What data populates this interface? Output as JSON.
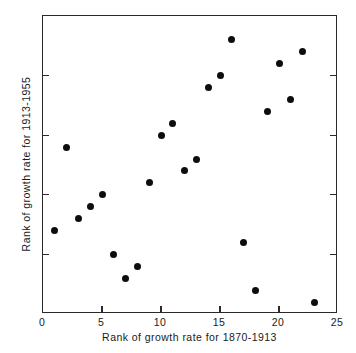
{
  "chart_data": {
    "type": "scatter",
    "title": "",
    "xlabel": "Rank of growth rate for 1870-1913",
    "ylabel": "Rank of growth rate for 1913-1955",
    "xlim": [
      0,
      25
    ],
    "ylim": [
      0,
      25
    ],
    "grid": false,
    "legend": null,
    "xticks": [
      0,
      5,
      10,
      15,
      20,
      25
    ],
    "yticks": [
      0,
      5,
      10,
      15,
      20,
      25
    ],
    "xtick_labels": [
      "0",
      "5",
      "10",
      "15",
      "20",
      "25"
    ],
    "ytick_labels": [
      "0",
      "5",
      "10",
      "15",
      "20",
      "25"
    ],
    "marker": "filled-circle",
    "marker_color": "#0d0d0d",
    "marker_size_px": 7,
    "n_points": 23,
    "x": [
      1,
      2,
      3,
      4,
      5,
      6,
      7,
      8,
      9,
      10,
      11,
      12,
      13,
      14,
      15,
      16,
      17,
      18,
      19,
      20,
      21,
      22,
      23
    ],
    "y": [
      7,
      14,
      8,
      9,
      10,
      5,
      3,
      4,
      11,
      15,
      16,
      12,
      13,
      19,
      20,
      23,
      6,
      2,
      17,
      21,
      18,
      22,
      1
    ],
    "points": [
      {
        "x": 1,
        "y": 7
      },
      {
        "x": 2,
        "y": 14
      },
      {
        "x": 3,
        "y": 8
      },
      {
        "x": 4,
        "y": 9
      },
      {
        "x": 5,
        "y": 10
      },
      {
        "x": 6,
        "y": 5
      },
      {
        "x": 7,
        "y": 3
      },
      {
        "x": 8,
        "y": 4
      },
      {
        "x": 9,
        "y": 11
      },
      {
        "x": 10,
        "y": 15
      },
      {
        "x": 11,
        "y": 16
      },
      {
        "x": 12,
        "y": 12
      },
      {
        "x": 13,
        "y": 13
      },
      {
        "x": 14,
        "y": 19
      },
      {
        "x": 15,
        "y": 20
      },
      {
        "x": 16,
        "y": 23
      },
      {
        "x": 17,
        "y": 6
      },
      {
        "x": 18,
        "y": 2
      },
      {
        "x": 19,
        "y": 17
      },
      {
        "x": 20,
        "y": 21
      },
      {
        "x": 21,
        "y": 18
      },
      {
        "x": 22,
        "y": 22
      },
      {
        "x": 23,
        "y": 1
      }
    ]
  }
}
